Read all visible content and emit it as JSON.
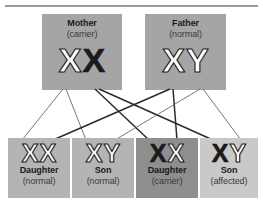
{
  "diagram": {
    "type": "x-linked-inheritance-punnett",
    "top_divider": true,
    "parents": [
      {
        "id": "mother",
        "title": "Mother",
        "subtitle": "(carrier)",
        "box_color": "#a5a5a5",
        "chromosomes": [
          {
            "letter": "X",
            "style": "white"
          },
          {
            "letter": "X",
            "style": "black"
          }
        ]
      },
      {
        "id": "father",
        "title": "Father",
        "subtitle": "(normal)",
        "box_color": "#a5a5a5",
        "chromosomes": [
          {
            "letter": "X",
            "style": "white"
          },
          {
            "letter": "Y",
            "style": "white"
          }
        ]
      }
    ],
    "children": [
      {
        "id": "daughter-normal",
        "title": "Daughter",
        "subtitle": "(normal)",
        "box_color": "#b4b4b4",
        "chromosomes": [
          {
            "letter": "X",
            "style": "white"
          },
          {
            "letter": "X",
            "style": "white"
          }
        ]
      },
      {
        "id": "son-normal",
        "title": "Son",
        "subtitle": "(normal)",
        "box_color": "#b4b4b4",
        "chromosomes": [
          {
            "letter": "X",
            "style": "white"
          },
          {
            "letter": "Y",
            "style": "white"
          }
        ]
      },
      {
        "id": "daughter-carrier",
        "title": "Daughter",
        "subtitle": "(carrier)",
        "box_color": "#8e8e8e",
        "chromosomes": [
          {
            "letter": "X",
            "style": "black"
          },
          {
            "letter": "X",
            "style": "white"
          }
        ]
      },
      {
        "id": "son-affected",
        "title": "Son",
        "subtitle": "(affected)",
        "box_color": "#c9c9c9",
        "chromosomes": [
          {
            "letter": "X",
            "style": "black"
          },
          {
            "letter": "Y",
            "style": "white"
          }
        ]
      }
    ],
    "connectors": [
      {
        "from": "mother-X-white",
        "to": "daughter-normal-X1",
        "weight": "thin"
      },
      {
        "from": "mother-X-white",
        "to": "son-normal-X1",
        "weight": "thin"
      },
      {
        "from": "mother-X-black",
        "to": "daughter-carrier-X1",
        "weight": "thick"
      },
      {
        "from": "mother-X-black",
        "to": "son-affected-X1",
        "weight": "thick"
      },
      {
        "from": "father-X-white",
        "to": "daughter-normal-X2",
        "weight": "thick"
      },
      {
        "from": "father-X-white",
        "to": "daughter-carrier-X2",
        "weight": "thick"
      },
      {
        "from": "father-Y-white",
        "to": "son-normal-Y",
        "weight": "thin"
      },
      {
        "from": "father-Y-white",
        "to": "son-affected-Y",
        "weight": "thin"
      }
    ]
  }
}
